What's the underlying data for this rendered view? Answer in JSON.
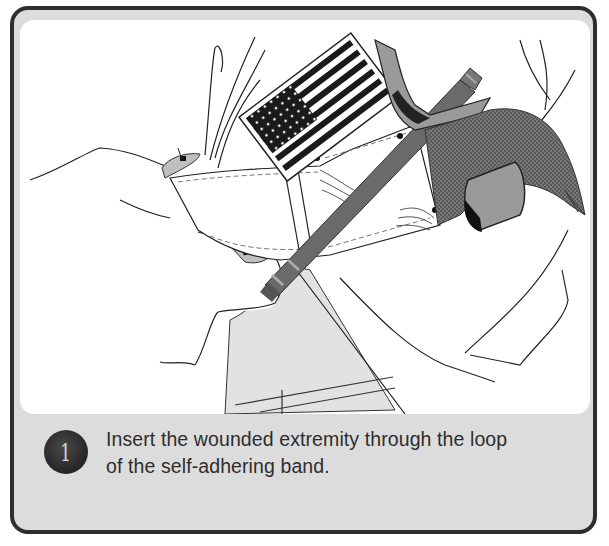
{
  "instruction_card": {
    "illustration": {
      "subject": "tourniquet-application-illustration",
      "elements": [
        "hand",
        "arm-sleeve",
        "american-flag-patch",
        "tourniquet-band",
        "windlass-rod",
        "windlass-clip",
        "velcro-strap"
      ]
    },
    "step": {
      "number": "1",
      "text_line_1": "Insert the wounded extremity through the loop",
      "text_line_2": "of the self-adhering band."
    },
    "colors": {
      "frame_border": "#2e2e2e",
      "frame_background": "#dcdcdc",
      "panel_background": "#ffffff",
      "badge": "#2a2a2a",
      "text": "#2d2d2d"
    }
  }
}
